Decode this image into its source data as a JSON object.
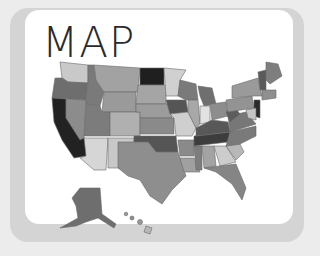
{
  "title": "MAP",
  "colors": {
    "background": "#ececec",
    "frame": "#d4d4d4",
    "card": "#ffffff",
    "title": "#2a2a2a"
  },
  "map": {
    "subject": "United States choropleth (grayscale)",
    "regions": [
      "contiguous-us",
      "alaska",
      "hawaii"
    ]
  }
}
